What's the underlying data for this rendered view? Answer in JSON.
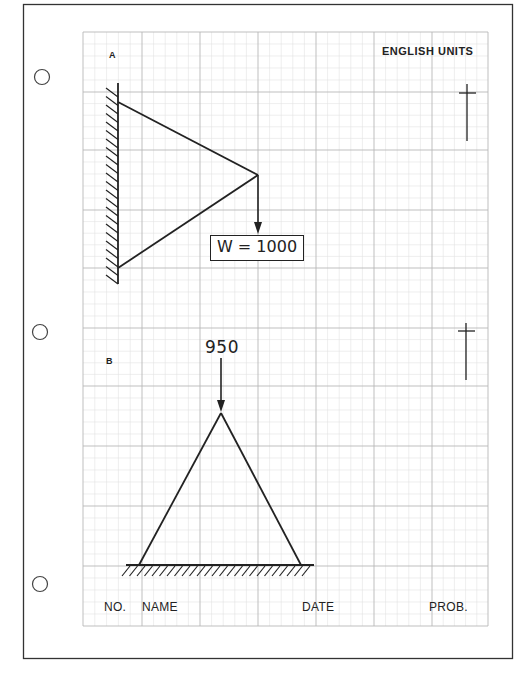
{
  "header": {
    "units_label": "ENGLISH UNITS"
  },
  "problem_a": {
    "label": "A",
    "load_label": "W = 1000"
  },
  "problem_b": {
    "label": "B",
    "load_value": "950"
  },
  "footer": {
    "no_label": "NO.",
    "name_label": "NAME",
    "date_label": "DATE",
    "prob_label": "PROB."
  },
  "colors": {
    "ink": "#222222",
    "grid_major": "#b8b8b8",
    "grid_minor": "#e2e2e2",
    "paper": "#ffffff"
  }
}
